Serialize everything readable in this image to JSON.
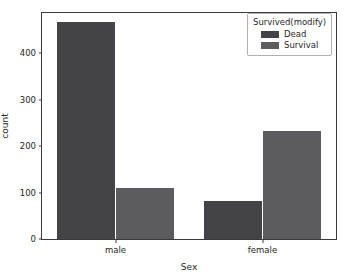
{
  "chart_data": {
    "type": "bar",
    "title": "",
    "xlabel": "Sex",
    "ylabel": "count",
    "categories": [
      "male",
      "female"
    ],
    "series": [
      {
        "name": "Dead",
        "values": [
          468,
          81
        ],
        "color": "#444448"
      },
      {
        "name": "Survival",
        "values": [
          109,
          233
        ],
        "color": "#5b5b60"
      }
    ],
    "legend": {
      "title": "Survived(modify)",
      "position": "upper right",
      "entries": [
        "Dead",
        "Survival"
      ]
    },
    "ylim": [
      0,
      487
    ],
    "yticks": [
      0,
      100,
      200,
      300,
      400
    ],
    "ytick_labels": [
      "0",
      "100",
      "200",
      "300",
      "400"
    ],
    "xtick_labels": [
      "male",
      "female"
    ],
    "grid": false,
    "background": "#ffffff",
    "axis_color": "#3a3a3a",
    "text_color": "#262626"
  }
}
